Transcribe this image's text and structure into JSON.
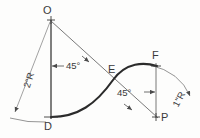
{
  "drawing": {
    "title": "Ogee (reverse) curve construction",
    "background_color": "#fdfdfc",
    "line_color": "#4a4a4a",
    "curve_color": "#2b2b2b",
    "text_color": "#3a3a3a",
    "points": [
      {
        "id": "O",
        "label": "O",
        "x": 51,
        "y": 20
      },
      {
        "id": "D",
        "label": "D",
        "x": 51,
        "y": 116
      },
      {
        "id": "E",
        "label": "E",
        "x": 113,
        "y": 80
      },
      {
        "id": "F",
        "label": "F",
        "x": 156,
        "y": 67
      },
      {
        "id": "P",
        "label": "P",
        "x": 156,
        "y": 117
      }
    ],
    "dimensions": [
      {
        "id": "radius-left",
        "label": "2\"R",
        "rotation": -72,
        "x": 22,
        "y": 84
      },
      {
        "id": "radius-right",
        "label": "1\"R",
        "rotation": -62,
        "x": 174,
        "y": 103
      }
    ],
    "angles": [
      {
        "id": "angle-left",
        "label": "45°",
        "x": 66,
        "y": 61
      },
      {
        "id": "angle-right",
        "label": "45°",
        "x": 117,
        "y": 92
      }
    ]
  }
}
